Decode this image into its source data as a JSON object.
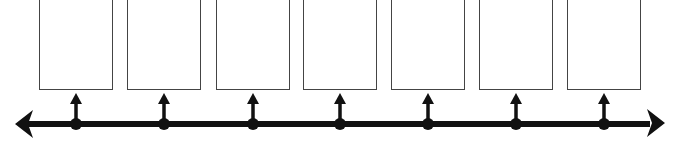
{
  "diagram": {
    "type": "timeline",
    "direction": "bidirectional",
    "line_color": "#111111",
    "box_border_color": "#444444",
    "events": [
      {
        "index": 1,
        "label": "",
        "x": 76
      },
      {
        "index": 2,
        "label": "",
        "x": 164
      },
      {
        "index": 3,
        "label": "",
        "x": 253
      },
      {
        "index": 4,
        "label": "",
        "x": 340
      },
      {
        "index": 5,
        "label": "",
        "x": 428
      },
      {
        "index": 6,
        "label": "",
        "x": 516
      },
      {
        "index": 7,
        "label": "",
        "x": 604
      }
    ]
  }
}
